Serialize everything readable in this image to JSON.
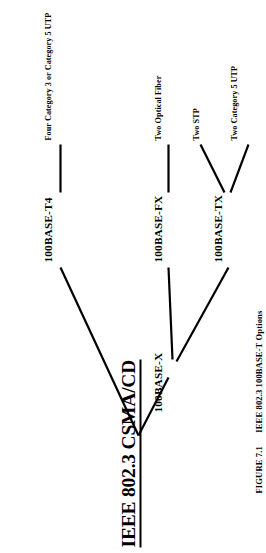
{
  "figure": {
    "root": {
      "label": "IEEE 802.3 CSMA/CD"
    },
    "nodes": {
      "base_x": "100BASE-X",
      "base_t4": "100BASE-T4",
      "base_fx": "100BASE-FX",
      "base_tx": "100BASE-TX"
    },
    "leaves": {
      "t4_media": "Four Category 3 or Category 5 UTP",
      "fx_media": "Two Optical Fiber",
      "tx_stp_media": "Two STP",
      "tx_utp_media": "Two Category 5 UTP"
    },
    "caption": {
      "number": "FIGURE 7.1",
      "text": "IEEE 802.3  100BASE-T Options"
    },
    "colors": {
      "ink": "#000000",
      "page": "#ffffff"
    },
    "orientation": "rotated-90-counter-clockwise"
  }
}
